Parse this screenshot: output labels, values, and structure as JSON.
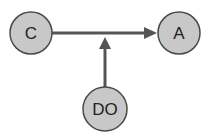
{
  "diagram": {
    "nodes": [
      {
        "id": "C",
        "label": "C"
      },
      {
        "id": "A",
        "label": "A"
      },
      {
        "id": "DO",
        "label": "DO"
      }
    ],
    "edges": [
      {
        "from": "C",
        "to": "A",
        "type": "directed"
      },
      {
        "from": "DO",
        "to": "C->A",
        "type": "directed",
        "note": "moderates edge"
      }
    ],
    "colors": {
      "node_fill": "#c8c8c8",
      "node_stroke": "#4a4a4a",
      "edge": "#555555"
    }
  }
}
